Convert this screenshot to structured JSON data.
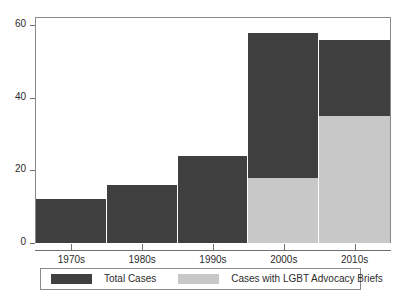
{
  "chart_data": {
    "type": "bar",
    "title": "",
    "subtitle": "",
    "xlabel": "",
    "ylabel": "",
    "categories": [
      "1970s",
      "1980s",
      "1990s",
      "2000s",
      "2010s"
    ],
    "series": [
      {
        "name": "Total Cases",
        "color": "#3f3f3f",
        "values": [
          12,
          16,
          24,
          58,
          56
        ]
      },
      {
        "name": "Cases with LGBT Advocacy Briefs",
        "color": "#c8c8c8",
        "values": [
          0,
          0,
          0,
          18,
          35
        ]
      }
    ],
    "ylim": [
      0,
      62
    ],
    "yticks": [
      0,
      20,
      40,
      60
    ],
    "ytick_labels": [
      "0",
      "20",
      "40",
      "60"
    ],
    "grid": false,
    "legend_position": "bottom",
    "overlay": true,
    "bar_gap": 0
  },
  "axes": {
    "y": {
      "ticks": [
        {
          "label": "60",
          "value": 60
        },
        {
          "label": "40",
          "value": 40
        },
        {
          "label": "20",
          "value": 20
        },
        {
          "label": "0",
          "value": 0
        }
      ]
    },
    "x": {
      "ticks": [
        {
          "label": "1970s"
        },
        {
          "label": "1980s"
        },
        {
          "label": "1990s"
        },
        {
          "label": "2000s"
        },
        {
          "label": "2010s"
        }
      ]
    }
  },
  "legend": {
    "entries": [
      {
        "label": "Total Cases",
        "color": "#3f3f3f"
      },
      {
        "label": "Cases with LGBT Advocacy Briefs",
        "color": "#c8c8c8"
      }
    ]
  },
  "colors": {
    "total_cases": "#3f3f3f",
    "lgbt_briefs": "#c8c8c8",
    "axis": "#6f6f6f",
    "frame": "#8a8a8a",
    "background": "#ffffff",
    "text": "#2b2b2b"
  }
}
